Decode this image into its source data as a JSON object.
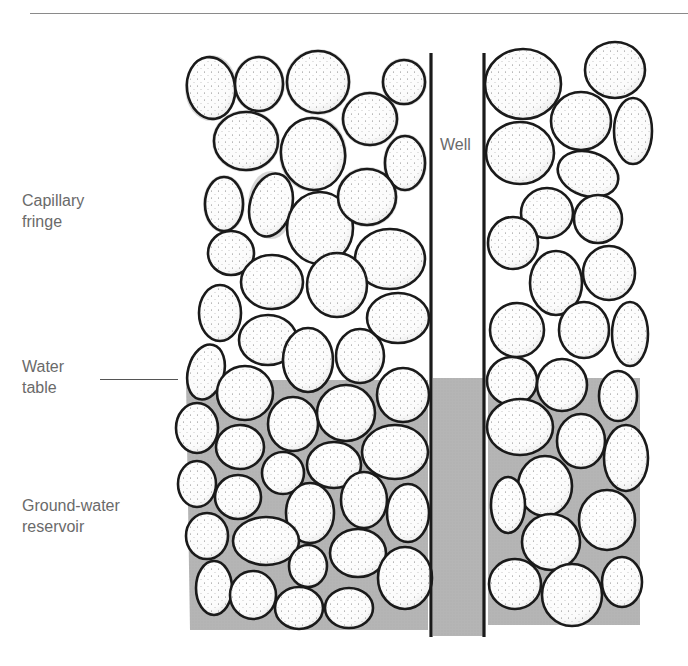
{
  "diagram": {
    "labels": {
      "capillary_fringe": "Capillary\nfringe",
      "water_table": "Water\ntable",
      "groundwater_reservoir": "Ground-water\nreservoir",
      "well": "Well"
    },
    "colors": {
      "water": "#b3b3b3",
      "pebble_fill": "#ffffff",
      "pebble_outline": "#1a1a1a",
      "halo": "#c9c9c9",
      "label_text": "#6a6a6a",
      "well_wall": "#1a1a1a"
    },
    "geometry": {
      "well_left_wall_x": 431,
      "well_right_wall_x": 484,
      "well_top_y": 53,
      "well_bottom_y": 636,
      "water_table_y": 378
    }
  }
}
